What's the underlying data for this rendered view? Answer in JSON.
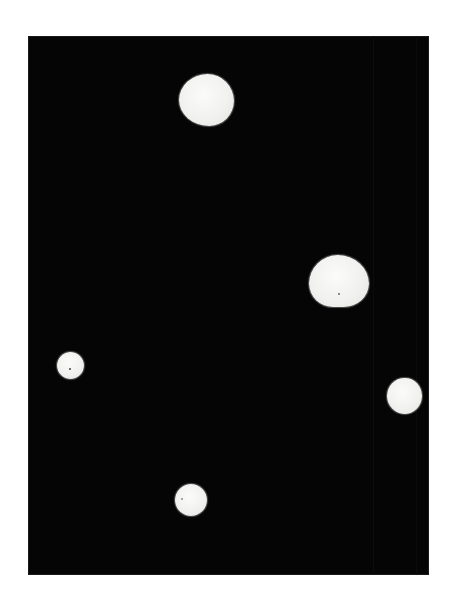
{
  "image": {
    "description": "Five irregular white blobs on a black rectangular background",
    "background_color": "#ffffff",
    "plate": {
      "color": "#050505",
      "x": 28,
      "y": 36,
      "width": 401,
      "height": 539
    },
    "blobs": [
      {
        "name": "top",
        "x": 179,
        "y": 74,
        "w": 55,
        "h": 52,
        "radius": "52% 48% 45% 55% / 50% 52% 48% 50%",
        "color": "#f4f4f2"
      },
      {
        "name": "right-middle",
        "x": 309,
        "y": 255,
        "w": 60,
        "h": 52,
        "radius": "48% 52% 42% 40% / 55% 55% 45% 45%",
        "color": "#f4f4f2"
      },
      {
        "name": "left-small",
        "x": 57,
        "y": 352,
        "w": 27,
        "h": 27,
        "radius": "50%",
        "color": "#f2f2f0"
      },
      {
        "name": "right-small",
        "x": 387,
        "y": 378,
        "w": 35,
        "h": 36,
        "radius": "50% 48% 50% 52% / 50% 50% 50% 50%",
        "color": "#f2f2f0"
      },
      {
        "name": "bottom",
        "x": 175,
        "y": 484,
        "w": 32,
        "h": 32,
        "radius": "50%",
        "color": "#f2f2f0"
      }
    ]
  }
}
